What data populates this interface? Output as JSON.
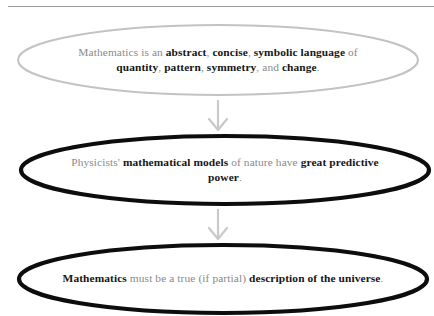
{
  "diagram": {
    "type": "flowchart",
    "orientation": "vertical",
    "background_color": "#ffffff",
    "text_color_regular": "#8a8a8a",
    "text_color_bold": "#161616",
    "top_rule_color": "#9b9b9b",
    "arrow_color": "#c9c9c9",
    "nodes": [
      {
        "id": "node-1",
        "shape": "ellipse",
        "stroke_color": "#c3c3c3",
        "stroke_width": 2,
        "plain_text": "Mathematics is an abstract, concise, symbolic language of quantity, pattern, symmetry, and change.",
        "runs": [
          {
            "text": "Mathematics is an ",
            "bold": false
          },
          {
            "text": "abstract",
            "bold": true
          },
          {
            "text": ", ",
            "bold": false
          },
          {
            "text": "concise",
            "bold": true
          },
          {
            "text": ", ",
            "bold": false
          },
          {
            "text": "symbolic language",
            "bold": true
          },
          {
            "text": " of ",
            "bold": false
          },
          {
            "text": "quantity",
            "bold": true
          },
          {
            "text": ", ",
            "bold": false
          },
          {
            "text": "pattern",
            "bold": true
          },
          {
            "text": ", ",
            "bold": false
          },
          {
            "text": "symmetry",
            "bold": true
          },
          {
            "text": ", and ",
            "bold": false
          },
          {
            "text": "change",
            "bold": true
          },
          {
            "text": ".",
            "bold": false
          }
        ]
      },
      {
        "id": "node-2",
        "shape": "ellipse",
        "stroke_color": "#0d0d0d",
        "stroke_width": 4,
        "plain_text": "Physicists' mathematical models of nature have great predictive power.",
        "runs": [
          {
            "text": "Physicists' ",
            "bold": false
          },
          {
            "text": "mathematical models",
            "bold": true
          },
          {
            "text": " of nature have ",
            "bold": false
          },
          {
            "text": "great predictive power",
            "bold": true
          },
          {
            "text": ".",
            "bold": false
          }
        ]
      },
      {
        "id": "node-3",
        "shape": "ellipse",
        "stroke_color": "#0d0d0d",
        "stroke_width": 4,
        "plain_text": "Mathematics must be a true (if partial) description of the universe.",
        "runs": [
          {
            "text": "Mathematics",
            "bold": true
          },
          {
            "text": " must be a true (if partial) ",
            "bold": false
          },
          {
            "text": "description of the universe",
            "bold": true
          },
          {
            "text": ".",
            "bold": false
          }
        ]
      }
    ],
    "connectors": [
      {
        "id": "arrow-1",
        "from": "node-1",
        "to": "node-2",
        "direction": "down",
        "color": "#c9c9c9"
      },
      {
        "id": "arrow-2",
        "from": "node-2",
        "to": "node-3",
        "direction": "down",
        "color": "#c9c9c9"
      }
    ]
  }
}
